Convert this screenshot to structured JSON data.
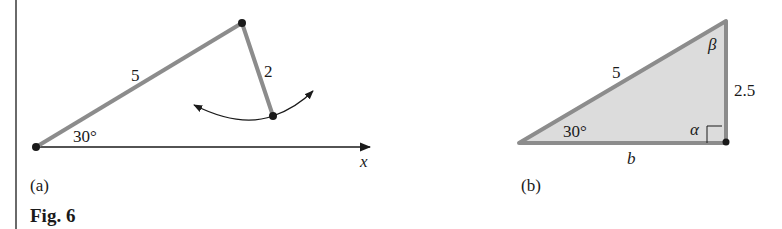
{
  "figure": {
    "caption": "Fig. 6",
    "panels": [
      {
        "id": "a",
        "label": "(a)",
        "segments": [
          {
            "name": "long-arm",
            "length_label": "5"
          },
          {
            "name": "short-arm",
            "length_label": "2"
          }
        ],
        "angle_label": "30°",
        "axis_label": "x"
      },
      {
        "id": "b",
        "label": "(b)",
        "hypotenuse_label": "5",
        "vertical_side_label": "2.5",
        "base_label": "b",
        "angle_bottom_left": "30°",
        "angle_top": "β",
        "angle_bottom_right": "α"
      }
    ]
  },
  "colors": {
    "segment": "#8c8c8c",
    "fill": "#dcdcdc",
    "ink": "#1a1a1a"
  }
}
